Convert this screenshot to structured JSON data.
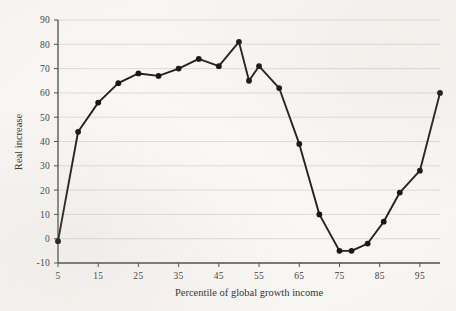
{
  "chart_data": {
    "type": "line",
    "title": "",
    "xlabel": "Percentile of global growth income",
    "ylabel": "Real increase",
    "xlim": [
      5,
      100
    ],
    "ylim": [
      -10,
      90
    ],
    "grid": true,
    "legend": null,
    "xticks": [
      5,
      15,
      25,
      35,
      45,
      55,
      65,
      75,
      85,
      95
    ],
    "xtick_labels": [
      "5",
      "15",
      "25",
      "35",
      "45",
      "55",
      "65",
      "75",
      "85",
      "95"
    ],
    "yticks": [
      -10,
      0,
      10,
      20,
      30,
      40,
      50,
      60,
      70,
      80,
      90
    ],
    "ytick_labels": [
      "-10",
      "0",
      "10",
      "20",
      "30",
      "40",
      "50",
      "60",
      "70",
      "80",
      "90"
    ],
    "x": [
      5,
      10,
      15,
      20,
      25,
      30,
      35,
      40,
      45,
      50,
      55,
      60,
      65,
      70,
      75,
      80,
      85,
      90,
      95,
      100
    ],
    "values": [
      -1,
      44,
      56,
      64,
      68,
      67,
      70,
      74,
      71,
      81,
      65,
      71,
      62,
      39,
      10,
      -5,
      -2,
      7,
      19,
      28
    ],
    "series": [
      {
        "name": "Real increase",
        "x": [
          5,
          10,
          15,
          20,
          25,
          30,
          35,
          40,
          45,
          50,
          52.5,
          55,
          60,
          65,
          70,
          75,
          78,
          82,
          86,
          90,
          95,
          100
        ],
        "values": [
          -1,
          44,
          56,
          64,
          68,
          67,
          70,
          74,
          71,
          81,
          65,
          71,
          62,
          39,
          10,
          -5,
          -5,
          -2,
          7,
          19,
          28,
          60
        ],
        "color": "#1c1b1a",
        "marker": "circle"
      }
    ],
    "colors": {
      "line": "#1c1b1a",
      "marker": "#131211",
      "grid": "#d2d1cd",
      "axis": "#4a4947",
      "background": "#fbfaf7",
      "text": "#2e2d2b"
    }
  }
}
